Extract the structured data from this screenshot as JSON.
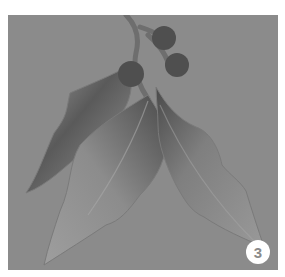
{
  "illustration": {
    "subject": "holly leaves and berries painting",
    "background_color": "#8b8b8b",
    "leaf_light_color": "#9a9a9a",
    "leaf_dark_color": "#4e4e4e",
    "berry_color": "#4f4f4f",
    "berries": [
      {
        "cx": 156,
        "cy": 23,
        "r": 12
      },
      {
        "cx": 169,
        "cy": 50,
        "r": 12
      },
      {
        "cx": 123,
        "cy": 59,
        "r": 13
      }
    ]
  },
  "badge": {
    "label": "3",
    "background_color": "#ffffff",
    "text_color": "#8a8a8a"
  }
}
